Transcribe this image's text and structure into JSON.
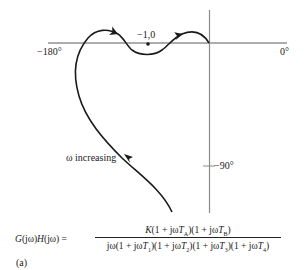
{
  "figure": {
    "type": "nyquist-style polar plot (Nichols-type phase diagram)",
    "caption": "(a)",
    "axis_labels": {
      "left_phase": "−180°",
      "right_phase": "0°",
      "vertical_tick": "−90°",
      "critical_point": "−1,0"
    },
    "annotation": "ω increasing",
    "formula": {
      "lhs": "G(jω)H(jω) =",
      "numerator": "K(1 + jωT_A)(1 + jωT_B)",
      "denominator": "jω(1 + jωT_1)(1 + jωT_2)(1 + jωT_3)(1 + jωT_4)"
    },
    "colors": {
      "axis": "#888888",
      "curve": "#1a1a1a",
      "text": "#222222"
    }
  }
}
